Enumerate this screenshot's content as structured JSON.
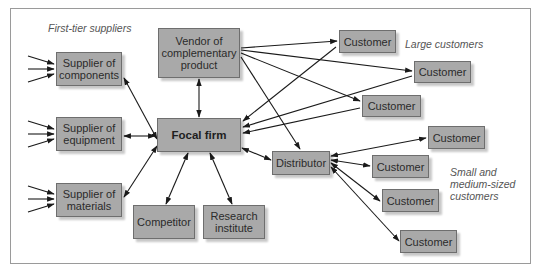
{
  "labels": {
    "first_tier": "First-tier suppliers",
    "large_customers": "Large customers",
    "small_customers": [
      "Small and",
      "medium-sized",
      "customers"
    ]
  },
  "nodes": {
    "supplier_components": "Supplier of components",
    "supplier_equipment": "Supplier of equipment",
    "supplier_materials": "Supplier of materials",
    "vendor": "Vendor of complementary product",
    "focal": "Focal firm",
    "competitor": "Competitor",
    "research": "Research institute",
    "distributor": "Distributor",
    "customer": "Customer"
  },
  "colors": {
    "box_fill": "#a9a9a9",
    "box_border": "#6e6e6e",
    "arrow": "#1a1a1a",
    "label": "#555555"
  }
}
